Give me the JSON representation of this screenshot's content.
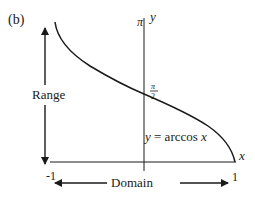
{
  "panel_label": "(b)",
  "range_label": "Range",
  "domain_label": "Domain",
  "y_axis": {
    "label": "y",
    "top_tick": "π"
  },
  "x_axis": {
    "label": "x",
    "left_tick": "-1",
    "right_tick": "1"
  },
  "mid_tick": {
    "numerator": "π",
    "denominator": "2"
  },
  "curve_label": {
    "lhs": "y",
    "eq": " = arccos ",
    "var": "x"
  },
  "colors": {
    "ink": "#1a1a1a",
    "background": "#ffffff"
  }
}
